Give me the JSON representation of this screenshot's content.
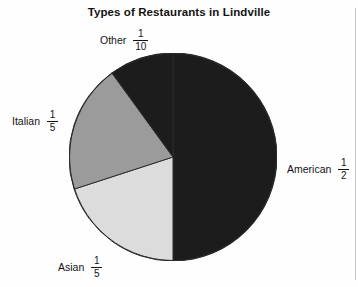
{
  "page": {
    "background_color": "#fefefe",
    "scan_edge_color": "#c9c9c9"
  },
  "chart_data": {
    "type": "pie",
    "title": "Types of Restaurants in Lindville",
    "xlabel": "",
    "ylabel": "",
    "legend_position": "none",
    "grid": false,
    "label_format": "fraction",
    "start_angle_deg": 0,
    "direction": "clockwise",
    "center": {
      "x": 104,
      "y": 104
    },
    "radius": 104,
    "categories": [
      "American",
      "Asian",
      "Italian",
      "Other"
    ],
    "values": [
      0.5,
      0.2,
      0.2,
      0.1
    ],
    "slices": [
      {
        "name": "American",
        "label": "American",
        "fraction_numerator": "1",
        "fraction_denominator": "2",
        "value": 0.5,
        "percent": 50,
        "color": "#1c1c1c",
        "start_angle_deg": 0,
        "end_angle_deg": 180
      },
      {
        "name": "Asian",
        "label": "Asian",
        "fraction_numerator": "1",
        "fraction_denominator": "5",
        "value": 0.2,
        "percent": 20,
        "color": "#dcdcdc",
        "start_angle_deg": 180,
        "end_angle_deg": 252
      },
      {
        "name": "Italian",
        "label": "Italian",
        "fraction_numerator": "1",
        "fraction_denominator": "5",
        "value": 0.2,
        "percent": 20,
        "color": "#9b9b9b",
        "start_angle_deg": 252,
        "end_angle_deg": 324
      },
      {
        "name": "Other",
        "label": "Other",
        "fraction_numerator": "1",
        "fraction_denominator": "10",
        "value": 0.1,
        "percent": 10,
        "color": "#1c1c1c",
        "start_angle_deg": 324,
        "end_angle_deg": 360
      }
    ],
    "outline_color": "#2b2b2b"
  }
}
